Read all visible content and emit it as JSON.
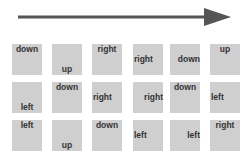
{
  "arrow": {
    "direction": "right",
    "color": "#555555"
  },
  "box_color": "#cfcfcf",
  "grid": {
    "rows": [
      [
        {
          "label": "down",
          "position": "top"
        },
        {
          "label": "up",
          "position": "bottom"
        },
        {
          "label": "right",
          "position": "top"
        },
        {
          "label": "right",
          "position": "left"
        },
        {
          "label": "down",
          "position": "right"
        },
        {
          "label": "up",
          "position": "top"
        }
      ],
      [
        {
          "label": "left",
          "position": "bottom"
        },
        {
          "label": "down",
          "position": "top"
        },
        {
          "label": "right",
          "position": "left"
        },
        {
          "label": "right",
          "position": "right"
        },
        {
          "label": "down",
          "position": "top"
        },
        {
          "label": "left",
          "position": "left"
        }
      ],
      [
        {
          "label": "left",
          "position": "top"
        },
        {
          "label": "up",
          "position": "bottom"
        },
        {
          "label": "down",
          "position": "top"
        },
        {
          "label": "left",
          "position": "left"
        },
        {
          "label": "left",
          "position": "right"
        },
        {
          "label": "right",
          "position": "top"
        }
      ]
    ]
  }
}
